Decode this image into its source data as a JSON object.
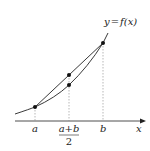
{
  "diagram": {
    "curve_label": "y = f(x)",
    "axis_label": "x",
    "ticks": [
      {
        "label": "a",
        "x": 35
      },
      {
        "label": "a+b",
        "sub": "2",
        "x": 69
      },
      {
        "label": "b",
        "x": 103
      }
    ],
    "points": [
      {
        "name": "f(a)",
        "x": 35,
        "y": 107
      },
      {
        "name": "chord-midpoint",
        "x": 69,
        "y": 75
      },
      {
        "name": "f((a+b)/2)",
        "x": 69,
        "y": 85
      },
      {
        "name": "f(b)",
        "x": 103,
        "y": 43
      }
    ],
    "colors": {
      "line": "#222222",
      "guide": "#888888"
    }
  },
  "labels": {
    "y_eq": "y",
    "eq": "=",
    "f": "f",
    "paren_x": "(x)",
    "x": "x",
    "a": "a",
    "b": "b",
    "mid_num": "a+b",
    "mid_den": "2"
  }
}
